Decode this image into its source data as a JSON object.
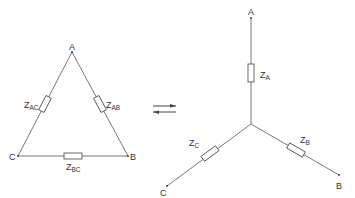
{
  "delta": {
    "nodes": {
      "A": "A",
      "B": "B",
      "C": "C"
    },
    "impedances": {
      "AB": {
        "main": "Z",
        "sub": "AB"
      },
      "AC": {
        "main": "Z",
        "sub": "AC"
      },
      "BC": {
        "main": "Z",
        "sub": "BC"
      }
    }
  },
  "star": {
    "nodes": {
      "A": "A",
      "B": "B",
      "C": "C"
    },
    "impedances": {
      "A": {
        "main": "Z",
        "sub": "A"
      },
      "B": {
        "main": "Z",
        "sub": "B"
      },
      "C": {
        "main": "Z",
        "sub": "C"
      }
    }
  },
  "transform_symbol": "equilibrium-arrows",
  "colors": {
    "line": "#555555",
    "text": "#333333",
    "background": "#ffffff"
  }
}
